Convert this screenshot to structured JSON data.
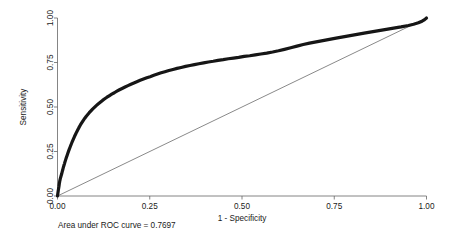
{
  "chart_data": {
    "type": "line",
    "title": "",
    "xlabel": "1 - Specificity",
    "ylabel": "Sensitivity",
    "xlim": [
      0.0,
      1.0
    ],
    "ylim": [
      0.0,
      1.0
    ],
    "grid": false,
    "legend": "none",
    "annotation": "Area under ROC curve = 0.7697",
    "auc": 0.7697,
    "xticks": [
      "0.00",
      "0.25",
      "0.50",
      "0.75",
      "1.00"
    ],
    "xtick_values": [
      0.0,
      0.25,
      0.5,
      0.75,
      1.0
    ],
    "yticks": [
      "0.00",
      "0.25",
      "0.50",
      "0.75",
      "1.00"
    ],
    "ytick_values": [
      0.0,
      0.25,
      0.5,
      0.75,
      1.0
    ],
    "series": [
      {
        "name": "ROC curve",
        "color": "#161616",
        "x": [
          0.0,
          0.002,
          0.004,
          0.005,
          0.006,
          0.007,
          0.008,
          0.009,
          0.01,
          0.011,
          0.012,
          0.013,
          0.014,
          0.015,
          0.016,
          0.018,
          0.019,
          0.02,
          0.022,
          0.024,
          0.026,
          0.028,
          0.03,
          0.032,
          0.034,
          0.036,
          0.038,
          0.04,
          0.043,
          0.046,
          0.049,
          0.052,
          0.055,
          0.058,
          0.062,
          0.066,
          0.07,
          0.074,
          0.078,
          0.082,
          0.086,
          0.09,
          0.095,
          0.1,
          0.105,
          0.11,
          0.116,
          0.122,
          0.128,
          0.134,
          0.14,
          0.147,
          0.154,
          0.161,
          0.168,
          0.175,
          0.183,
          0.191,
          0.199,
          0.207,
          0.215,
          0.224,
          0.233,
          0.242,
          0.251,
          0.261,
          0.271,
          0.281,
          0.291,
          0.302,
          0.313,
          0.324,
          0.335,
          0.347,
          0.359,
          0.371,
          0.383,
          0.396,
          0.409,
          0.422,
          0.435,
          0.449,
          0.463,
          0.477,
          0.491,
          0.506,
          0.521,
          0.536,
          0.551,
          0.567,
          0.583,
          0.599,
          0.615,
          0.632,
          0.649,
          0.666,
          0.683,
          0.701,
          0.719,
          0.737,
          0.755,
          0.774,
          0.793,
          0.812,
          0.831,
          0.851,
          0.871,
          0.891,
          0.911,
          0.931,
          0.951,
          0.965,
          0.978,
          0.988,
          0.995,
          1.0
        ],
        "y": [
          0.0,
          0.03,
          0.055,
          0.07,
          0.082,
          0.092,
          0.1,
          0.108,
          0.115,
          0.122,
          0.13,
          0.138,
          0.146,
          0.154,
          0.162,
          0.175,
          0.182,
          0.19,
          0.203,
          0.216,
          0.228,
          0.24,
          0.252,
          0.263,
          0.274,
          0.285,
          0.295,
          0.305,
          0.32,
          0.334,
          0.347,
          0.36,
          0.372,
          0.384,
          0.399,
          0.412,
          0.425,
          0.437,
          0.448,
          0.458,
          0.468,
          0.477,
          0.488,
          0.498,
          0.508,
          0.517,
          0.527,
          0.537,
          0.546,
          0.555,
          0.563,
          0.572,
          0.58,
          0.589,
          0.597,
          0.604,
          0.612,
          0.62,
          0.628,
          0.635,
          0.642,
          0.65,
          0.657,
          0.664,
          0.67,
          0.678,
          0.685,
          0.692,
          0.698,
          0.705,
          0.711,
          0.717,
          0.722,
          0.728,
          0.733,
          0.738,
          0.743,
          0.748,
          0.753,
          0.757,
          0.762,
          0.766,
          0.771,
          0.775,
          0.779,
          0.784,
          0.788,
          0.793,
          0.798,
          0.803,
          0.809,
          0.816,
          0.824,
          0.833,
          0.842,
          0.851,
          0.859,
          0.866,
          0.873,
          0.88,
          0.887,
          0.894,
          0.901,
          0.908,
          0.915,
          0.922,
          0.929,
          0.936,
          0.943,
          0.95,
          0.958,
          0.965,
          0.973,
          0.982,
          0.991,
          1.0
        ]
      },
      {
        "name": "Reference line",
        "color": "#6b6b6b",
        "x": [
          0.0,
          1.0
        ],
        "y": [
          0.0,
          1.0
        ]
      }
    ]
  },
  "axes": {
    "y_title": "Sensitivity",
    "x_title": "1 - Specificity"
  },
  "note": {
    "text": "Area under ROC curve = 0.7697"
  }
}
